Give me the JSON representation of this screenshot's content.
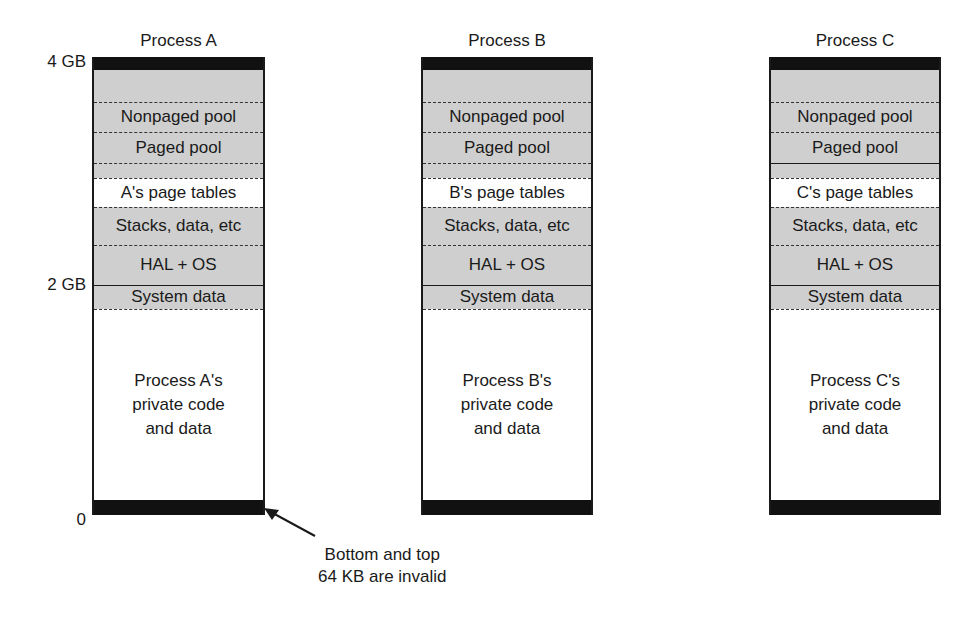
{
  "axis": {
    "top_label": "4 GB",
    "mid_label": "2 GB",
    "bottom_label": "0"
  },
  "processes": [
    {
      "title": "Process A",
      "page_tables": "A's page tables",
      "private": [
        "Process A's",
        "private code",
        "and data"
      ],
      "paged_pool_bottom_line": "dashed"
    },
    {
      "title": "Process B",
      "page_tables": "B's page tables",
      "private": [
        "Process B's",
        "private code",
        "and data"
      ],
      "paged_pool_bottom_line": "dashed"
    },
    {
      "title": "Process C",
      "page_tables": "C's page tables",
      "private": [
        "Process C's",
        "private code",
        "and data"
      ],
      "paged_pool_bottom_line": "solid"
    }
  ],
  "regions": {
    "nonpaged_pool": "Nonpaged pool",
    "paged_pool": "Paged pool",
    "stacks": "Stacks, data, etc",
    "hal_os": "HAL + OS",
    "system_data": "System data"
  },
  "annotation": {
    "line1": "Bottom and top",
    "line2": "64 KB are invalid"
  },
  "colors": {
    "shaded": "#cfcfcf",
    "invalid": "#111111",
    "outline": "#1a1a1a"
  }
}
